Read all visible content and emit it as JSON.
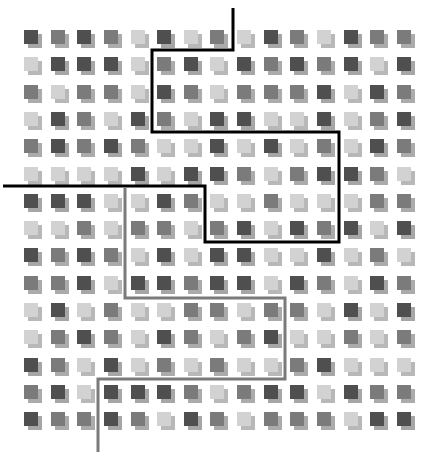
{
  "grid": {
    "rows": 15,
    "cols": 15,
    "origin_x": 24,
    "origin_y": 30,
    "step_x": 26.64,
    "step_y": 27.3,
    "legend": {
      "D": "dark",
      "M": "medium",
      "L": "light"
    },
    "colors": {
      "D": {
        "front": "#4f4f4f",
        "shadow": "#a6a6a6"
      },
      "M": {
        "front": "#7b7b7b",
        "shadow": "#ababab"
      },
      "L": {
        "front": "#d2d2d2",
        "shadow": "#b8b8b8"
      }
    },
    "cells": [
      [
        "D",
        "M",
        "D",
        "M",
        "L",
        "D",
        "L",
        "M",
        "L",
        "D",
        "M",
        "L",
        "D",
        "M",
        "M"
      ],
      [
        "L",
        "D",
        "D",
        "D",
        "L",
        "M",
        "D",
        "L",
        "D",
        "M",
        "D",
        "M",
        "D",
        "L",
        "D"
      ],
      [
        "M",
        "L",
        "M",
        "M",
        "L",
        "D",
        "M",
        "L",
        "M",
        "M",
        "M",
        "D",
        "L",
        "D",
        "M"
      ],
      [
        "L",
        "D",
        "M",
        "L",
        "D",
        "M",
        "L",
        "D",
        "D",
        "L",
        "L",
        "D",
        "L",
        "M",
        "D"
      ],
      [
        "M",
        "D",
        "M",
        "D",
        "M",
        "L",
        "L",
        "D",
        "L",
        "D",
        "L",
        "M",
        "L",
        "D",
        "M"
      ],
      [
        "L",
        "L",
        "L",
        "L",
        "D",
        "L",
        "D",
        "D",
        "M",
        "L",
        "M",
        "D",
        "D",
        "M",
        "L"
      ],
      [
        "D",
        "D",
        "D",
        "L",
        "L",
        "D",
        "M",
        "L",
        "L",
        "M",
        "L",
        "L",
        "L",
        "M",
        "M"
      ],
      [
        "L",
        "L",
        "M",
        "L",
        "M",
        "M",
        "L",
        "M",
        "D",
        "L",
        "D",
        "M",
        "D",
        "L",
        "D"
      ],
      [
        "D",
        "M",
        "D",
        "M",
        "L",
        "D",
        "L",
        "D",
        "D",
        "L",
        "L",
        "D",
        "L",
        "M",
        "L"
      ],
      [
        "M",
        "M",
        "D",
        "L",
        "D",
        "D",
        "M",
        "D",
        "D",
        "L",
        "D",
        "M",
        "L",
        "D",
        "M"
      ],
      [
        "L",
        "D",
        "L",
        "M",
        "L",
        "L",
        "M",
        "M",
        "L",
        "M",
        "M",
        "L",
        "D",
        "L",
        "D"
      ],
      [
        "L",
        "M",
        "D",
        "M",
        "L",
        "D",
        "M",
        "L",
        "M",
        "D",
        "L",
        "L",
        "M",
        "L",
        "M"
      ],
      [
        "D",
        "M",
        "L",
        "D",
        "L",
        "M",
        "L",
        "M",
        "L",
        "L",
        "M",
        "D",
        "L",
        "L",
        "L"
      ],
      [
        "M",
        "D",
        "L",
        "D",
        "D",
        "D",
        "M",
        "L",
        "M",
        "D",
        "D",
        "L",
        "D",
        "M",
        "M"
      ],
      [
        "D",
        "M",
        "M",
        "D",
        "M",
        "L",
        "D",
        "M",
        "L",
        "M",
        "M",
        "M",
        "L",
        "D",
        "D"
      ]
    ]
  },
  "paths": [
    {
      "name": "black-boundary-path",
      "color": "#000000",
      "width": 3,
      "points": "233,8 233,50 152,50 152,132 339,132 339,242 205,242 205,186 3,186"
    },
    {
      "name": "gray-boundary-path",
      "color": "#7a7a7a",
      "width": 3,
      "points": "125,188 125,298 285,298 285,379 98,379 98,452"
    }
  ]
}
